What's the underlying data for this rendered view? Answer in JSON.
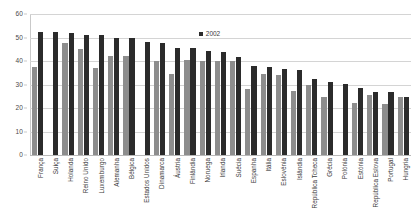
{
  "chart_data": {
    "type": "bar",
    "title": "",
    "xlabel": "",
    "ylabel": "",
    "ylim": [
      0,
      60
    ],
    "yticks": [
      0,
      10,
      20,
      30,
      40,
      50,
      60
    ],
    "grid": true,
    "legend_position": "top-center",
    "legend": [
      "2002"
    ],
    "categories": [
      "França",
      "Suíça",
      "Holanda",
      "Reino Unido",
      "Luxemburgo",
      "Alemanha",
      "Bélgica",
      "Estados Unidos",
      "Dinamarca",
      "Áustria",
      "Finlândia",
      "Noruega",
      "Irlanda",
      "Suécia",
      "Espanha",
      "Itália",
      "Eslovénia",
      "Islândia",
      "República Tcheca",
      "Grécia",
      "Polónia",
      "Estónia",
      "República Eslova",
      "Portugal",
      "Hungria"
    ],
    "series": [
      {
        "name": "",
        "color": "#8d8d8d",
        "values": [
          37.5,
          0,
          47.5,
          45.2,
          37.0,
          42.3,
          42.3,
          0,
          40.2,
          34.5,
          40.3,
          39.8,
          40.0,
          40.2,
          28.2,
          34.5,
          34.2,
          27.3,
          29.8,
          24.8,
          0,
          22.3,
          25.5,
          21.5,
          24.5
        ]
      },
      {
        "name": "2002",
        "color": "#2b2b2b",
        "values": [
          52.5,
          52.3,
          51.8,
          51.2,
          51.2,
          49.8,
          49.8,
          48.2,
          47.8,
          45.5,
          45.5,
          44.2,
          44.0,
          41.8,
          38.0,
          37.3,
          36.5,
          36.3,
          32.3,
          31.0,
          30.2,
          28.5,
          26.8,
          26.7,
          24.5
        ]
      }
    ]
  }
}
